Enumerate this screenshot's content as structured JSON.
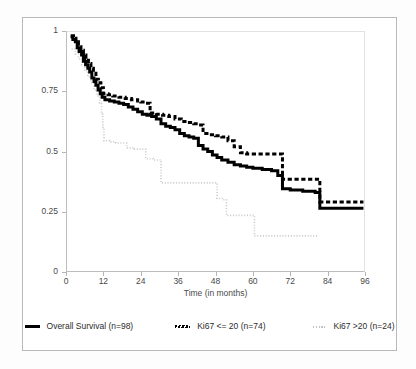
{
  "chart_data": {
    "type": "line",
    "subtype": "kaplan-meier-step",
    "title": "",
    "xlabel": "Time (in months)",
    "ylabel": "",
    "xlim": [
      0,
      96
    ],
    "ylim": [
      0,
      1
    ],
    "xticks": [
      0,
      12,
      24,
      36,
      48,
      60,
      72,
      84,
      96
    ],
    "xtick_labels": [
      "0",
      "12",
      "24",
      "36",
      "48",
      "60",
      "72",
      "84",
      "96"
    ],
    "yticks": [
      0,
      0.25,
      0.5,
      0.75,
      1
    ],
    "ytick_labels": [
      "0",
      "0.25",
      "0.5",
      "0.75",
      "1"
    ],
    "grid": false,
    "legend_position": "bottom",
    "series": [
      {
        "name": "Overall Survival (n=98)",
        "style": "solid-thick-black",
        "color": "#000000",
        "n": 98,
        "points": [
          [
            1.5,
            0.975
          ],
          [
            2.2,
            0.965
          ],
          [
            3.0,
            0.955
          ],
          [
            3.6,
            0.93
          ],
          [
            4.2,
            0.915
          ],
          [
            5.0,
            0.9
          ],
          [
            5.6,
            0.875
          ],
          [
            6.3,
            0.86
          ],
          [
            7.0,
            0.845
          ],
          [
            7.6,
            0.83
          ],
          [
            8.3,
            0.805
          ],
          [
            9.0,
            0.79
          ],
          [
            9.6,
            0.775
          ],
          [
            10.3,
            0.755
          ],
          [
            11.0,
            0.74
          ],
          [
            11.6,
            0.725
          ],
          [
            12.5,
            0.715
          ],
          [
            14.0,
            0.71
          ],
          [
            15.5,
            0.705
          ],
          [
            17.0,
            0.7
          ],
          [
            18.5,
            0.695
          ],
          [
            20.0,
            0.685
          ],
          [
            21.5,
            0.675
          ],
          [
            23.0,
            0.665
          ],
          [
            24.5,
            0.655
          ],
          [
            26.0,
            0.65
          ],
          [
            27.5,
            0.645
          ],
          [
            29.0,
            0.635
          ],
          [
            30.5,
            0.615
          ],
          [
            32.0,
            0.605
          ],
          [
            33.5,
            0.6
          ],
          [
            35.0,
            0.59
          ],
          [
            36.5,
            0.575
          ],
          [
            38.0,
            0.565
          ],
          [
            39.5,
            0.56
          ],
          [
            41.0,
            0.555
          ],
          [
            42.5,
            0.525
          ],
          [
            44.0,
            0.51
          ],
          [
            45.5,
            0.5
          ],
          [
            47.0,
            0.485
          ],
          [
            48.5,
            0.475
          ],
          [
            50.0,
            0.465
          ],
          [
            52.0,
            0.455
          ],
          [
            54.0,
            0.445
          ],
          [
            56.0,
            0.44
          ],
          [
            58.0,
            0.435
          ],
          [
            60.0,
            0.43
          ],
          [
            63.0,
            0.425
          ],
          [
            66.0,
            0.42
          ],
          [
            68.0,
            0.4
          ],
          [
            69.5,
            0.345
          ],
          [
            72.0,
            0.34
          ],
          [
            76.0,
            0.335
          ],
          [
            80.0,
            0.33
          ],
          [
            81.5,
            0.265
          ],
          [
            84.0,
            0.265
          ],
          [
            90.0,
            0.265
          ],
          [
            95.5,
            0.265
          ]
        ]
      },
      {
        "name": "Ki67 <= 20 (n=74)",
        "style": "dashed-thick-black",
        "color": "#000000",
        "n": 74,
        "points": [
          [
            1.5,
            0.98
          ],
          [
            2.4,
            0.97
          ],
          [
            3.2,
            0.955
          ],
          [
            4.0,
            0.935
          ],
          [
            4.8,
            0.92
          ],
          [
            5.6,
            0.9
          ],
          [
            6.4,
            0.885
          ],
          [
            7.2,
            0.865
          ],
          [
            8.0,
            0.845
          ],
          [
            8.8,
            0.825
          ],
          [
            9.6,
            0.8
          ],
          [
            10.4,
            0.785
          ],
          [
            11.2,
            0.765
          ],
          [
            12.0,
            0.74
          ],
          [
            13.5,
            0.735
          ],
          [
            15.0,
            0.73
          ],
          [
            17.0,
            0.725
          ],
          [
            19.0,
            0.72
          ],
          [
            21.0,
            0.715
          ],
          [
            23.0,
            0.71
          ],
          [
            24.0,
            0.705
          ],
          [
            25.5,
            0.7
          ],
          [
            27.0,
            0.66
          ],
          [
            29.0,
            0.655
          ],
          [
            31.0,
            0.65
          ],
          [
            33.0,
            0.645
          ],
          [
            35.0,
            0.635
          ],
          [
            37.0,
            0.625
          ],
          [
            39.0,
            0.62
          ],
          [
            41.0,
            0.615
          ],
          [
            42.5,
            0.61
          ],
          [
            44.0,
            0.575
          ],
          [
            46.0,
            0.57
          ],
          [
            48.0,
            0.565
          ],
          [
            50.0,
            0.56
          ],
          [
            52.0,
            0.545
          ],
          [
            54.0,
            0.52
          ],
          [
            56.0,
            0.495
          ],
          [
            58.0,
            0.49
          ],
          [
            60.0,
            0.49
          ],
          [
            64.0,
            0.49
          ],
          [
            68.0,
            0.49
          ],
          [
            69.5,
            0.385
          ],
          [
            72.0,
            0.385
          ],
          [
            76.0,
            0.385
          ],
          [
            80.0,
            0.385
          ],
          [
            81.5,
            0.29
          ],
          [
            84.0,
            0.29
          ],
          [
            90.0,
            0.29
          ],
          [
            95.5,
            0.29
          ]
        ]
      },
      {
        "name": "Ki67 >20 (n=24)",
        "style": "dotted-light-grey",
        "color": "#c9c9c9",
        "n": 24,
        "points": [
          [
            1.8,
            0.925
          ],
          [
            3.0,
            0.905
          ],
          [
            4.0,
            0.885
          ],
          [
            5.0,
            0.86
          ],
          [
            6.0,
            0.835
          ],
          [
            7.0,
            0.81
          ],
          [
            8.0,
            0.785
          ],
          [
            9.0,
            0.755
          ],
          [
            10.0,
            0.73
          ],
          [
            10.8,
            0.7
          ],
          [
            11.4,
            0.655
          ],
          [
            11.8,
            0.6
          ],
          [
            12.2,
            0.545
          ],
          [
            14.0,
            0.54
          ],
          [
            16.0,
            0.535
          ],
          [
            18.0,
            0.535
          ],
          [
            19.5,
            0.515
          ],
          [
            22.0,
            0.51
          ],
          [
            24.0,
            0.51
          ],
          [
            25.0,
            0.51
          ],
          [
            25.6,
            0.47
          ],
          [
            28.0,
            0.465
          ],
          [
            29.5,
            0.465
          ],
          [
            30.5,
            0.37
          ],
          [
            34.0,
            0.37
          ],
          [
            38.0,
            0.37
          ],
          [
            42.0,
            0.37
          ],
          [
            46.0,
            0.37
          ],
          [
            47.5,
            0.37
          ],
          [
            48.5,
            0.305
          ],
          [
            50.5,
            0.3
          ],
          [
            51.5,
            0.235
          ],
          [
            55.0,
            0.235
          ],
          [
            58.0,
            0.235
          ],
          [
            60.0,
            0.235
          ],
          [
            60.5,
            0.15
          ],
          [
            66.0,
            0.15
          ],
          [
            72.0,
            0.15
          ],
          [
            78.0,
            0.15
          ],
          [
            81.0,
            0.15
          ]
        ]
      }
    ]
  },
  "axes": {
    "x_title": "Time (in months)",
    "y_tick_labels": [
      "1",
      "0.75",
      "0.5",
      "0.25",
      "0"
    ],
    "x_tick_labels": [
      "0",
      "12",
      "24",
      "36",
      "48",
      "60",
      "72",
      "84",
      "96"
    ]
  },
  "legend": {
    "items": [
      {
        "label": "Overall Survival (n=98)",
        "marker": "solid-line-swatch"
      },
      {
        "label": "Ki67 <= 20 (n=74)",
        "marker": "dashed-line-swatch"
      },
      {
        "label": "Ki67 >20 (n=24)",
        "marker": "dotted-line-swatch"
      }
    ]
  },
  "colors": {
    "overall_survival": "#000000",
    "ki67_low": "#000000",
    "ki67_high": "#c9c9c9",
    "axis": "#bdbdbd",
    "frame": "#b9b9b9",
    "text": "#4a4a4a",
    "background": "#ffffff"
  }
}
